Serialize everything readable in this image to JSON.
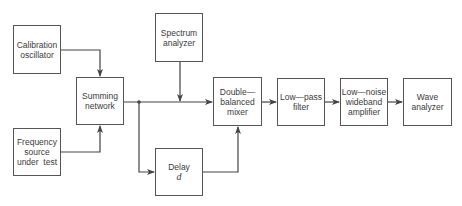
{
  "diagram": {
    "type": "block-diagram",
    "blocks": [
      {
        "id": "calibration_oscillator",
        "lines": [
          "Calibration",
          "oscillator"
        ]
      },
      {
        "id": "frequency_source",
        "lines": [
          "Frequency",
          "source",
          "under  test"
        ]
      },
      {
        "id": "summing_network",
        "lines": [
          "Summing",
          "network"
        ]
      },
      {
        "id": "spectrum_analyzer",
        "lines": [
          "Spectrum",
          "analyzer"
        ]
      },
      {
        "id": "delay",
        "lines": [
          "Delay"
        ],
        "symbol": "d"
      },
      {
        "id": "mixer",
        "lines": [
          "Double—",
          "balanced",
          "mixer"
        ]
      },
      {
        "id": "low_pass_filter",
        "lines": [
          "Low—pass",
          "filter"
        ]
      },
      {
        "id": "lna",
        "lines": [
          "Low—noise",
          "wideband",
          "amplifier"
        ]
      },
      {
        "id": "wave_analyzer",
        "lines": [
          "Wave",
          "analyzer"
        ]
      }
    ],
    "connections": [
      {
        "from": "calibration_oscillator",
        "to": "summing_network"
      },
      {
        "from": "frequency_source",
        "to": "summing_network"
      },
      {
        "from": "summing_network",
        "to": "mixer"
      },
      {
        "from": "summing_network",
        "to": "delay"
      },
      {
        "from": "spectrum_analyzer",
        "to": "summing-mixer line"
      },
      {
        "from": "delay",
        "to": "mixer"
      },
      {
        "from": "mixer",
        "to": "low_pass_filter"
      },
      {
        "from": "low_pass_filter",
        "to": "lna"
      },
      {
        "from": "lna",
        "to": "wave_analyzer"
      }
    ],
    "colors": {
      "line": "#444444",
      "box_border": "#555555",
      "text": "#3a3a3a"
    }
  }
}
